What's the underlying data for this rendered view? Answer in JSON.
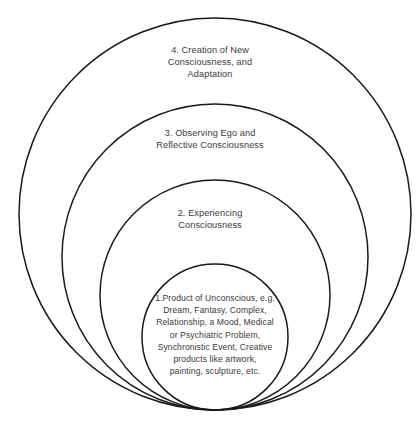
{
  "diagram": {
    "background_color": "#ffffff",
    "stroke_color": "#1a1a1a",
    "text_color": "#3a3a3a",
    "tangent_point": {
      "x": 215,
      "y": 410
    },
    "center_x": 215,
    "rings": [
      {
        "index": 4,
        "radius": 196,
        "top_y": 18,
        "label": "4. Creation of New\nConsciousness, and\nAdaptation"
      },
      {
        "index": 3,
        "radius": 153,
        "top_y": 104,
        "label": "3. Observing Ego and\nReflective Consciousness"
      },
      {
        "index": 2,
        "radius": 115,
        "top_y": 180,
        "label": "2. Experiencing\nConsciousness"
      },
      {
        "index": 1,
        "radius": 73,
        "top_y": 264,
        "label": "1.Product of Unconscious, e.g.\nDream, Fantasy, Complex,\nRelationship, a Mood, Medical\nor Psychiatric Problem,\nSynchronistic Event, Creative\nproducts like artwork,\npainting, sculpture, etc."
      }
    ]
  }
}
